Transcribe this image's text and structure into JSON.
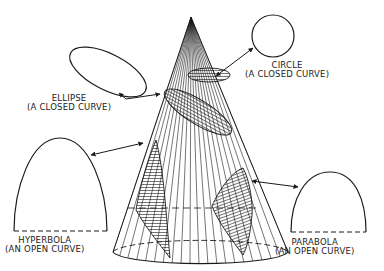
{
  "diagram": {
    "ink_color": "#1a1a1a",
    "background": "#ffffff",
    "shapes": [
      {
        "id": "circle",
        "name": "CIRCLE",
        "description": "(A CLOSED CURVE)"
      },
      {
        "id": "ellipse",
        "name": "ELLIPSE",
        "description": "(A CLOSED CURVE)"
      },
      {
        "id": "hyperbola",
        "name": "HYPERBOLA",
        "description": "(AN OPEN CURVE)"
      },
      {
        "id": "parabola",
        "name": "PARABOLA",
        "description": "(AN OPEN CURVE)"
      }
    ]
  }
}
